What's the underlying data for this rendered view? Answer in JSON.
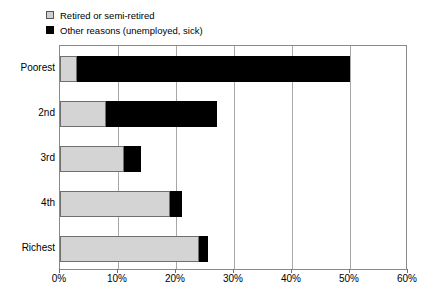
{
  "legend": {
    "position": "above-plot-left",
    "items": [
      {
        "label": "Retired or semi-retired",
        "color": "#d4d4d4",
        "swatch": "gray-square-icon"
      },
      {
        "label": "Other reasons (unemployed, sick)",
        "color": "#000000",
        "swatch": "black-square-icon"
      }
    ]
  },
  "axis": {
    "x_ticks": [
      "0%",
      "10%",
      "20%",
      "30%",
      "40%",
      "50%",
      "60%"
    ],
    "y_labels": [
      "Poorest",
      "2nd",
      "3rd",
      "4th",
      "Richest"
    ]
  },
  "caption": {
    "text": ""
  },
  "chart_data": {
    "type": "bar",
    "orientation": "horizontal",
    "stacked": true,
    "title": "",
    "subtitle": "",
    "xlabel": "",
    "ylabel": "",
    "xlim": [
      0,
      60
    ],
    "xunit": "%",
    "grid": true,
    "legend_position": "top-left",
    "categories": [
      "Poorest",
      "2nd",
      "3rd",
      "4th",
      "Richest"
    ],
    "series": [
      {
        "name": "Retired or semi-retired",
        "color": "#d4d4d4",
        "values": [
          3,
          8,
          11,
          19,
          24
        ]
      },
      {
        "name": "Other reasons (unemployed, sick)",
        "color": "#000000",
        "values": [
          47,
          19,
          3,
          2,
          1.5
        ]
      }
    ],
    "totals": [
      50,
      27,
      14,
      21,
      25.5
    ],
    "tick_values": [
      0,
      10,
      20,
      30,
      40,
      50,
      60
    ],
    "tick_labels": [
      "0%",
      "10%",
      "20%",
      "30%",
      "40%",
      "50%",
      "60%"
    ]
  }
}
